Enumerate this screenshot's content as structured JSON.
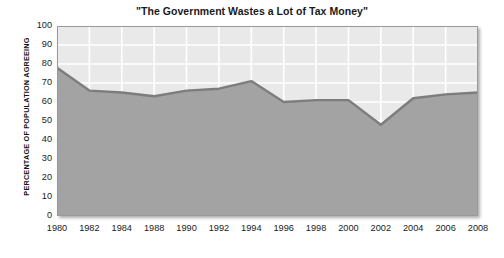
{
  "chart_data": {
    "type": "area",
    "title": "\"The Government Wastes a Lot of Tax Money\"",
    "xlabel": "",
    "ylabel": "PERCENTAGE OF POPULATION AGREEING",
    "categories": [
      "1980",
      "1982",
      "1984",
      "1988",
      "1990",
      "1992",
      "1994",
      "1996",
      "1998",
      "2000",
      "2002",
      "2004",
      "2006",
      "2008"
    ],
    "values": [
      78,
      66,
      65,
      63,
      66,
      67,
      71,
      60,
      61,
      61,
      48,
      62,
      64,
      65
    ],
    "ylim": [
      0,
      100
    ],
    "yticks": [
      100,
      90,
      80,
      70,
      60,
      50,
      40,
      30,
      20,
      10,
      0
    ],
    "grid": true,
    "legend": "none",
    "colors": {
      "area_fill": "#a3a3a3",
      "plot_background": "#e9e9e9",
      "line": "#7d7d7d",
      "gridline": "#ffffff",
      "border": "#9a9a9a",
      "text": "#1a1a1a"
    }
  }
}
